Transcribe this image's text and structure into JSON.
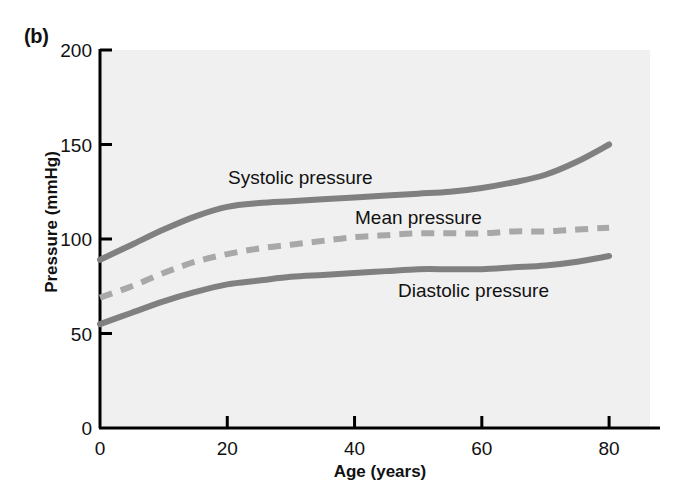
{
  "figure": {
    "panel_label": "(b)",
    "background_color": "#ffffff",
    "plot_background_color": "#f0f0f0",
    "axis_color": "#000000",
    "curve_color": "#808080"
  },
  "chart_data": {
    "type": "line",
    "title": "",
    "xlabel": "Age (years)",
    "ylabel": "Pressure (mmHg)",
    "xlim": [
      0,
      88
    ],
    "ylim": [
      0,
      200
    ],
    "xticks": [
      0,
      20,
      40,
      60,
      80
    ],
    "yticks": [
      0,
      50,
      100,
      150,
      200
    ],
    "grid": false,
    "legend_position": "inline-annotations",
    "series": [
      {
        "name": "Systolic pressure",
        "style": "solid",
        "color": "#808080",
        "label_text": "Systolic pressure",
        "x": [
          0,
          5,
          10,
          15,
          20,
          25,
          30,
          35,
          40,
          45,
          50,
          55,
          60,
          65,
          70,
          75,
          80
        ],
        "values": [
          89,
          97,
          105,
          112,
          117,
          119,
          120,
          121,
          122,
          123,
          124,
          125,
          127,
          130,
          134,
          141,
          150
        ]
      },
      {
        "name": "Mean pressure",
        "style": "dashed",
        "color": "#a8a8a8",
        "label_text": "Mean pressure",
        "x": [
          0,
          5,
          10,
          15,
          20,
          25,
          30,
          35,
          40,
          45,
          50,
          55,
          60,
          65,
          70,
          75,
          80
        ],
        "values": [
          69,
          75,
          82,
          88,
          92,
          95,
          97,
          99,
          101,
          102,
          103,
          103,
          103,
          104,
          104,
          105,
          106
        ]
      },
      {
        "name": "Diastolic pressure",
        "style": "solid",
        "color": "#808080",
        "label_text": "Diastolic pressure",
        "x": [
          0,
          5,
          10,
          15,
          20,
          25,
          30,
          35,
          40,
          45,
          50,
          55,
          60,
          65,
          70,
          75,
          80
        ],
        "values": [
          55,
          61,
          67,
          72,
          76,
          78,
          80,
          81,
          82,
          83,
          84,
          84,
          84,
          85,
          86,
          88,
          91
        ]
      }
    ],
    "annotations": [
      {
        "text": "Systolic pressure",
        "x_px": 228,
        "y_px": 184
      },
      {
        "text": "Mean pressure",
        "x_px": 355,
        "y_px": 224
      },
      {
        "text": "Diastolic pressure",
        "x_px": 398,
        "y_px": 297
      }
    ]
  }
}
